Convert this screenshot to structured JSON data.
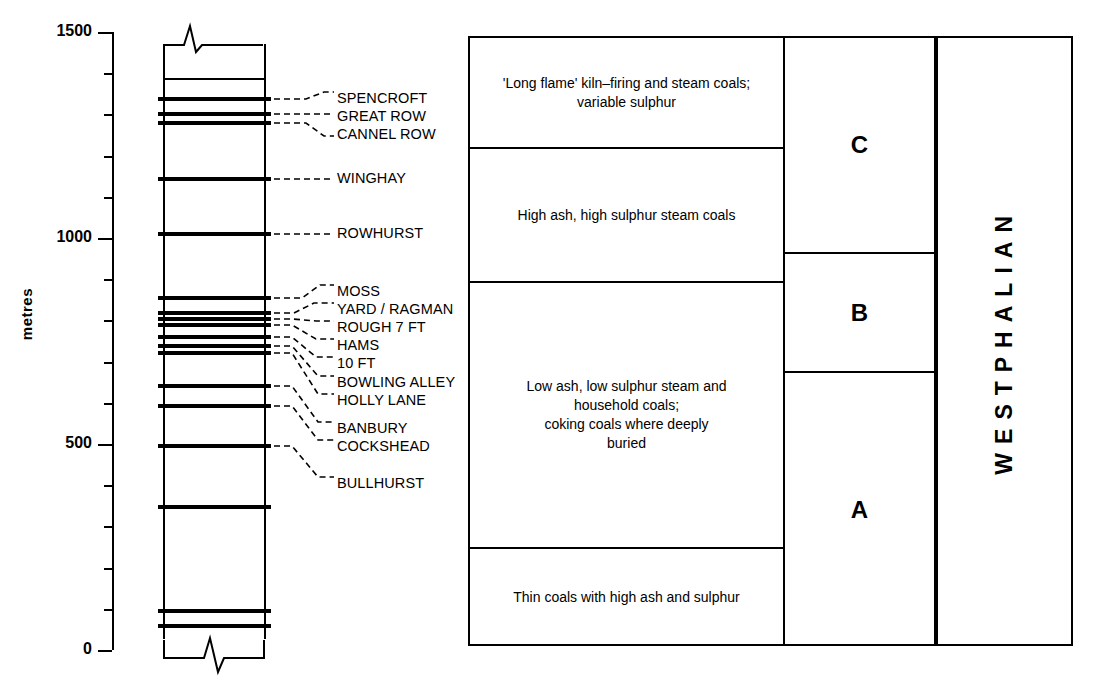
{
  "axis": {
    "title": "metres",
    "major_ticks": [
      {
        "label": "1500",
        "value": 1500
      },
      {
        "label": "1000",
        "value": 1000
      },
      {
        "label": "500",
        "value": 500
      },
      {
        "label": "0",
        "value": 0
      }
    ],
    "minor_tick_values": [
      1400,
      1300,
      1200,
      1100,
      900,
      800,
      700,
      600,
      400,
      300,
      200,
      100
    ],
    "range": [
      0,
      1500
    ],
    "units": "metres"
  },
  "column": {
    "top_break_symbol": "zigzag",
    "bottom_break_symbol": "zigzag",
    "seams": [
      {
        "name": "SPENCROFT",
        "depth_m": 1340,
        "label_y": 98
      },
      {
        "name": "GREAT ROW",
        "depth_m": 1285,
        "label_y": 116
      },
      {
        "name": "CANNEL ROW",
        "depth_m": 1255,
        "label_y": 134
      },
      {
        "name": "WINGHAY",
        "depth_m": 1175,
        "label_y": 178
      },
      {
        "name": "ROWHURST",
        "depth_m": 1020,
        "label_y": 233
      },
      {
        "name": "MOSS",
        "depth_m": 875,
        "label_y": 291
      },
      {
        "name": "YARD / RAGMAN",
        "depth_m": 825,
        "label_y": 309
      },
      {
        "name": "ROUGH 7 FT",
        "depth_m": 805,
        "label_y": 327
      },
      {
        "name": "HAMS",
        "depth_m": 770,
        "label_y": 345
      },
      {
        "name": "10 FT",
        "depth_m": 740,
        "label_y": 363
      },
      {
        "name": "BOWLING ALLEY",
        "depth_m": 655,
        "label_y": 382
      },
      {
        "name": "HOLLY LANE",
        "depth_m": 605,
        "label_y": 400
      },
      {
        "name": "BANBURY",
        "depth_m": 520,
        "label_y": 428
      },
      {
        "name": "COCKSHEAD",
        "depth_m": 500,
        "label_y": 446
      },
      {
        "name": "BULLHURST",
        "depth_m": 355,
        "label_y": 483
      }
    ],
    "seam_band_y": [
      98,
      113,
      122,
      178,
      233,
      297,
      312,
      318,
      324,
      336,
      345,
      352,
      385,
      405,
      445,
      506,
      610,
      625
    ],
    "thin_lines_y": [
      78
    ]
  },
  "descriptions": [
    {
      "id": "desc-top",
      "text": "'Long flame' kiln–firing and steam coals;\nvariable sulphur"
    },
    {
      "id": "desc-upper-mid",
      "text": "High ash, high sulphur steam coals"
    },
    {
      "id": "desc-lower-mid",
      "text": "Low ash, low sulphur steam and\nhousehold coals;\ncoking coals where deeply\nburied"
    },
    {
      "id": "desc-bottom",
      "text": "Thin coals with high ash and sulphur"
    }
  ],
  "stages": [
    {
      "letter": "C"
    },
    {
      "letter": "B"
    },
    {
      "letter": "A"
    }
  ],
  "period": {
    "name": "WESTPHALIAN"
  },
  "colors": {
    "ink": "#000000",
    "background": "#ffffff"
  }
}
